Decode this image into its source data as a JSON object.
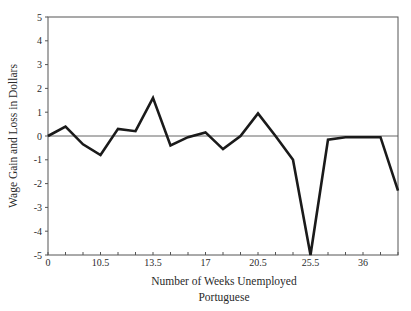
{
  "chart_data": {
    "type": "line",
    "title": "",
    "xlabel": "Number of Weeks Unemployed",
    "subtitle": "Portuguese",
    "ylabel": "Wage Gain and Loss in Dollars",
    "ylim": [
      -5,
      5
    ],
    "yticks": [
      5,
      4,
      3,
      2,
      1,
      0,
      -1,
      -2,
      -3,
      -4,
      -5
    ],
    "xtick_labels": [
      {
        "index": 0,
        "label": "0"
      },
      {
        "index": 3,
        "label": "10.5"
      },
      {
        "index": 6,
        "label": "13.5"
      },
      {
        "index": 9,
        "label": "17"
      },
      {
        "index": 12,
        "label": "20.5"
      },
      {
        "index": 15,
        "label": "25.5"
      },
      {
        "index": 18,
        "label": "36"
      }
    ],
    "num_points": 21,
    "grid": false,
    "legend": null,
    "reference_line": 0,
    "series": [
      {
        "name": "Portuguese",
        "color": "#1a1a1a",
        "values": [
          0,
          0.4,
          -0.35,
          -0.8,
          0.3,
          0.2,
          1.6,
          -0.4,
          -0.05,
          0.15,
          -0.55,
          0.0,
          0.95,
          0,
          -1.0,
          -5.0,
          -0.15,
          -0.05,
          -0.05,
          -0.05,
          -2.3
        ]
      }
    ]
  },
  "colors": {
    "line": "#1a1a1a",
    "axis": "#555555",
    "zero_line": "#666666"
  }
}
